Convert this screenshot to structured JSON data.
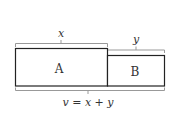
{
  "diagram": {
    "boxes": [
      {
        "id": "A",
        "label": "A"
      },
      {
        "id": "B",
        "label": "B"
      }
    ],
    "brackets": {
      "top_left": {
        "label": "x"
      },
      "top_right": {
        "label": "y"
      },
      "bottom": {
        "label": "v = x + y"
      }
    },
    "colors": {
      "stroke": "#222222",
      "bracket": "#888888",
      "text": "#333333"
    }
  }
}
